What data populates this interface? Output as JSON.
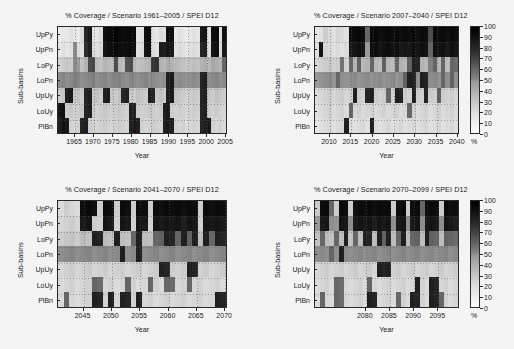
{
  "figure": {
    "background": "#f4f4f4",
    "ylabel": "Sub-basins",
    "xlabel": "Year",
    "colorbar_unit": "%",
    "colorbar_ticks": [
      "100",
      "90",
      "80",
      "70",
      "60",
      "50",
      "40",
      "30",
      "20",
      "10",
      "0"
    ],
    "row_labels": [
      "UpPy",
      "UpPn",
      "LoPy",
      "LoPn",
      "UpUy",
      "LoUy",
      "PlBn"
    ]
  },
  "chart_data": [
    {
      "type": "heatmap",
      "panel": "top-left",
      "title": "% Coverage / Scenario 1961–2005 / SPEI D12",
      "xlabel": "Year",
      "ylabel": "Sub-basins",
      "zlabel": "%",
      "zlim": [
        0,
        100
      ],
      "colormap": "gray-reversed",
      "grid": true,
      "legend": "colorbar-right-shared",
      "xticks": [
        1965,
        1970,
        1975,
        1980,
        1985,
        1990,
        1995,
        2000,
        2005
      ],
      "x": [
        1961,
        1962,
        1963,
        1964,
        1965,
        1966,
        1967,
        1968,
        1969,
        1970,
        1971,
        1972,
        1973,
        1974,
        1975,
        1976,
        1977,
        1978,
        1979,
        1980,
        1981,
        1982,
        1983,
        1984,
        1985,
        1986,
        1987,
        1988,
        1989,
        1990,
        1991,
        1992,
        1993,
        1994,
        1995,
        1996,
        1997,
        1998,
        1999,
        2000,
        2001,
        2002,
        2003,
        2004,
        2005
      ],
      "y": [
        "UpPy",
        "UpPn",
        "LoPy",
        "LoPn",
        "UpUy",
        "LoUy",
        "PlBn"
      ],
      "z": [
        [
          8,
          10,
          9,
          12,
          10,
          8,
          14,
          85,
          90,
          12,
          10,
          14,
          95,
          97,
          96,
          98,
          97,
          95,
          96,
          97,
          96,
          10,
          12,
          95,
          96,
          12,
          10,
          14,
          12,
          95,
          94,
          10,
          12,
          10,
          8,
          10,
          12,
          10,
          90,
          92,
          12,
          95,
          96,
          12,
          94
        ],
        [
          10,
          12,
          10,
          12,
          45,
          14,
          12,
          82,
          88,
          14,
          12,
          16,
          92,
          95,
          94,
          96,
          95,
          94,
          95,
          96,
          94,
          12,
          14,
          92,
          94,
          14,
          12,
          90,
          88,
          92,
          90,
          12,
          14,
          12,
          10,
          12,
          14,
          12,
          86,
          88,
          14,
          92,
          94,
          14,
          90
        ],
        [
          18,
          20,
          22,
          20,
          45,
          40,
          24,
          30,
          70,
          72,
          26,
          24,
          30,
          28,
          26,
          70,
          28,
          26,
          68,
          70,
          28,
          24,
          26,
          28,
          30,
          78,
          80,
          30,
          28,
          32,
          30,
          28,
          26,
          24,
          22,
          24,
          26,
          24,
          30,
          32,
          28,
          34,
          32,
          30,
          60
        ],
        [
          45,
          48,
          44,
          46,
          50,
          48,
          44,
          46,
          48,
          50,
          44,
          46,
          48,
          44,
          46,
          48,
          50,
          46,
          44,
          48,
          46,
          44,
          46,
          48,
          44,
          46,
          44,
          42,
          44,
          88,
          90,
          44,
          46,
          44,
          42,
          44,
          46,
          44,
          86,
          88,
          44,
          46,
          48,
          44,
          46
        ],
        [
          20,
          22,
          88,
          90,
          22,
          24,
          20,
          86,
          88,
          22,
          24,
          20,
          88,
          90,
          22,
          20,
          24,
          86,
          88,
          22,
          20,
          24,
          22,
          20,
          88,
          86,
          22,
          24,
          20,
          88,
          90,
          24,
          22,
          20,
          18,
          20,
          22,
          20,
          86,
          88,
          22,
          20,
          24,
          22,
          20
        ],
        [
          92,
          94,
          20,
          22,
          18,
          20,
          22,
          86,
          88,
          20,
          18,
          20,
          22,
          20,
          18,
          20,
          22,
          20,
          18,
          88,
          86,
          20,
          18,
          20,
          22,
          20,
          18,
          20,
          88,
          90,
          20,
          18,
          20,
          18,
          16,
          18,
          20,
          18,
          86,
          88,
          20,
          18,
          20,
          18,
          16
        ],
        [
          88,
          92,
          90,
          18,
          16,
          18,
          86,
          88,
          20,
          18,
          16,
          18,
          20,
          18,
          16,
          18,
          20,
          18,
          16,
          88,
          90,
          88,
          18,
          16,
          18,
          20,
          18,
          16,
          88,
          90,
          88,
          18,
          16,
          18,
          14,
          16,
          18,
          16,
          86,
          88,
          90,
          18,
          16,
          18,
          14
        ]
      ]
    },
    {
      "type": "heatmap",
      "panel": "top-right",
      "title": "% Coverage / Scenario 2007–2040 / SPEI D12",
      "xlabel": "Year",
      "ylabel": "Sub-basins",
      "zlabel": "%",
      "zlim": [
        0,
        100
      ],
      "colormap": "gray-reversed",
      "grid": true,
      "legend": "colorbar-right",
      "xticks": [
        2010,
        2015,
        2020,
        2025,
        2030,
        2035,
        2040
      ],
      "x": [
        2007,
        2008,
        2009,
        2010,
        2011,
        2012,
        2013,
        2014,
        2015,
        2016,
        2017,
        2018,
        2019,
        2020,
        2021,
        2022,
        2023,
        2024,
        2025,
        2026,
        2027,
        2028,
        2029,
        2030,
        2031,
        2032,
        2033,
        2034,
        2035,
        2036,
        2037,
        2038,
        2039,
        2040
      ],
      "y": [
        "UpPy",
        "UpPn",
        "LoPy",
        "LoPn",
        "UpUy",
        "LoUy",
        "PlBn"
      ],
      "z": [
        [
          10,
          12,
          20,
          14,
          12,
          16,
          14,
          12,
          95,
          96,
          97,
          95,
          60,
          96,
          97,
          95,
          96,
          97,
          95,
          96,
          94,
          96,
          95,
          96,
          94,
          96,
          95,
          70,
          96,
          95,
          96,
          94,
          96,
          95
        ],
        [
          12,
          92,
          16,
          14,
          12,
          14,
          12,
          14,
          90,
          92,
          94,
          92,
          40,
          94,
          95,
          92,
          94,
          95,
          92,
          94,
          90,
          92,
          90,
          94,
          92,
          94,
          92,
          60,
          94,
          92,
          94,
          90,
          94,
          92
        ],
        [
          16,
          18,
          20,
          22,
          18,
          20,
          55,
          18,
          60,
          30,
          62,
          28,
          30,
          60,
          28,
          26,
          62,
          28,
          26,
          60,
          30,
          28,
          62,
          88,
          86,
          30,
          28,
          50,
          60,
          28,
          60,
          26,
          60,
          58
        ],
        [
          40,
          42,
          44,
          46,
          42,
          60,
          44,
          42,
          44,
          46,
          42,
          44,
          46,
          42,
          44,
          46,
          42,
          44,
          46,
          42,
          44,
          62,
          88,
          86,
          44,
          88,
          86,
          44,
          46,
          42,
          60,
          44,
          62,
          44
        ],
        [
          14,
          16,
          18,
          20,
          16,
          18,
          20,
          16,
          18,
          88,
          20,
          18,
          86,
          88,
          20,
          18,
          20,
          60,
          18,
          88,
          86,
          20,
          18,
          88,
          20,
          18,
          86,
          20,
          18,
          62,
          20,
          18,
          20,
          16
        ],
        [
          12,
          14,
          16,
          18,
          14,
          16,
          18,
          14,
          60,
          16,
          18,
          14,
          16,
          18,
          14,
          16,
          18,
          14,
          16,
          18,
          14,
          16,
          60,
          18,
          14,
          16,
          18,
          14,
          16,
          18,
          14,
          16,
          18,
          14
        ],
        [
          10,
          12,
          14,
          16,
          12,
          14,
          16,
          88,
          14,
          12,
          14,
          16,
          12,
          88,
          14,
          12,
          14,
          16,
          12,
          14,
          16,
          12,
          14,
          16,
          12,
          14,
          16,
          12,
          14,
          16,
          12,
          14,
          16,
          12
        ]
      ]
    },
    {
      "type": "heatmap",
      "panel": "bottom-left",
      "title": "% Coverage / Scenario 2041–2070 / SPEI D12",
      "xlabel": "Year",
      "ylabel": "Sub-basins",
      "zlabel": "%",
      "zlim": [
        0,
        100
      ],
      "colormap": "gray-reversed",
      "grid": true,
      "legend": "colorbar-right-shared",
      "xticks": [
        2045,
        2050,
        2055,
        2060,
        2065,
        2070
      ],
      "x": [
        2041,
        2042,
        2043,
        2044,
        2045,
        2046,
        2047,
        2048,
        2049,
        2050,
        2051,
        2052,
        2053,
        2054,
        2055,
        2056,
        2057,
        2058,
        2059,
        2060,
        2061,
        2062,
        2063,
        2064,
        2065,
        2066,
        2067,
        2068,
        2069,
        2070
      ],
      "y": [
        "UpPy",
        "UpPn",
        "LoPy",
        "LoPn",
        "UpUy",
        "LoUy",
        "PlBn"
      ],
      "z": [
        [
          14,
          20,
          16,
          14,
          95,
          96,
          94,
          20,
          96,
          95,
          20,
          96,
          94,
          20,
          96,
          95,
          20,
          96,
          94,
          96,
          95,
          96,
          94,
          96,
          95,
          20,
          96,
          94,
          96,
          95
        ],
        [
          16,
          18,
          20,
          16,
          90,
          92,
          20,
          18,
          92,
          90,
          18,
          92,
          90,
          18,
          92,
          90,
          18,
          92,
          90,
          92,
          90,
          92,
          88,
          92,
          90,
          18,
          92,
          90,
          92,
          90
        ],
        [
          20,
          22,
          24,
          20,
          26,
          24,
          88,
          86,
          26,
          24,
          88,
          26,
          24,
          60,
          88,
          26,
          24,
          60,
          62,
          88,
          86,
          60,
          88,
          62,
          88,
          26,
          88,
          60,
          88,
          86
        ],
        [
          44,
          46,
          48,
          44,
          46,
          48,
          44,
          46,
          48,
          44,
          46,
          88,
          44,
          46,
          88,
          44,
          46,
          48,
          44,
          46,
          48,
          44,
          46,
          48,
          44,
          46,
          48,
          44,
          46,
          48
        ],
        [
          16,
          18,
          20,
          16,
          18,
          20,
          16,
          18,
          20,
          16,
          18,
          20,
          16,
          18,
          20,
          16,
          18,
          20,
          88,
          86,
          20,
          18,
          20,
          88,
          86,
          18,
          20,
          16,
          18,
          20
        ],
        [
          14,
          16,
          18,
          14,
          16,
          18,
          60,
          58,
          16,
          18,
          14,
          16,
          60,
          18,
          14,
          16,
          60,
          18,
          14,
          60,
          58,
          16,
          18,
          60,
          16,
          18,
          14,
          16,
          18,
          14
        ],
        [
          14,
          60,
          16,
          14,
          16,
          18,
          88,
          86,
          18,
          88,
          16,
          88,
          86,
          18,
          88,
          16,
          18,
          14,
          16,
          18,
          14,
          16,
          18,
          14,
          16,
          18,
          14,
          16,
          88,
          86
        ]
      ]
    },
    {
      "type": "heatmap",
      "panel": "bottom-right",
      "title": "% Coverage / Scenario 2070–2099 / SPEI D12",
      "xlabel": "Year",
      "ylabel": "Sub-basins",
      "zlabel": "%",
      "zlim": [
        0,
        100
      ],
      "colormap": "gray-reversed",
      "grid": true,
      "legend": "colorbar-right",
      "xticks": [
        2080,
        2085,
        2090,
        2095
      ],
      "x": [
        2070,
        2071,
        2072,
        2073,
        2074,
        2075,
        2076,
        2077,
        2078,
        2079,
        2080,
        2081,
        2082,
        2083,
        2084,
        2085,
        2086,
        2087,
        2088,
        2089,
        2090,
        2091,
        2092,
        2093,
        2094,
        2095,
        2096,
        2097,
        2098,
        2099
      ],
      "y": [
        "UpPy",
        "UpPn",
        "LoPy",
        "LoPn",
        "UpUy",
        "LoUy",
        "PlBn"
      ],
      "z": [
        [
          20,
          95,
          96,
          60,
          20,
          96,
          95,
          20,
          94,
          96,
          95,
          96,
          94,
          96,
          95,
          96,
          20,
          94,
          96,
          20,
          95,
          96,
          60,
          94,
          96,
          95,
          20,
          96,
          94,
          95
        ],
        [
          40,
          90,
          92,
          44,
          42,
          92,
          90,
          44,
          90,
          92,
          90,
          92,
          88,
          92,
          90,
          92,
          44,
          90,
          92,
          44,
          90,
          92,
          44,
          90,
          92,
          90,
          44,
          92,
          90,
          88
        ],
        [
          24,
          60,
          26,
          24,
          60,
          26,
          88,
          24,
          60,
          26,
          88,
          86,
          26,
          88,
          62,
          88,
          26,
          60,
          88,
          26,
          60,
          62,
          26,
          88,
          62,
          60,
          26,
          62,
          60,
          58
        ],
        [
          44,
          46,
          44,
          60,
          44,
          88,
          46,
          44,
          46,
          48,
          44,
          46,
          48,
          44,
          46,
          48,
          44,
          46,
          48,
          44,
          46,
          48,
          44,
          46,
          48,
          44,
          46,
          48,
          44,
          46
        ],
        [
          16,
          18,
          20,
          16,
          18,
          20,
          16,
          18,
          20,
          16,
          18,
          20,
          16,
          88,
          86,
          88,
          18,
          20,
          16,
          18,
          20,
          16,
          18,
          20,
          16,
          18,
          20,
          16,
          18,
          20
        ],
        [
          14,
          16,
          18,
          14,
          60,
          58,
          16,
          14,
          16,
          18,
          14,
          60,
          16,
          14,
          16,
          18,
          14,
          16,
          18,
          14,
          16,
          88,
          18,
          14,
          88,
          86,
          16,
          18,
          14,
          16
        ],
        [
          14,
          60,
          16,
          14,
          60,
          58,
          16,
          14,
          16,
          18,
          14,
          88,
          86,
          14,
          16,
          18,
          14,
          60,
          18,
          14,
          88,
          86,
          18,
          14,
          88,
          86,
          60,
          18,
          14,
          16
        ]
      ]
    }
  ]
}
